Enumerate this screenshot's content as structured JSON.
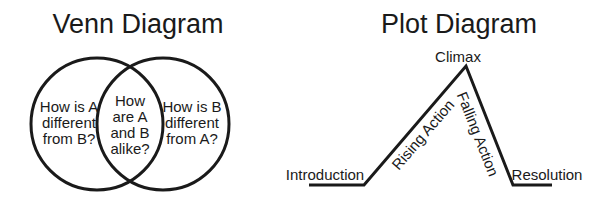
{
  "venn": {
    "title": "Venn Diagram",
    "left_region": [
      "How is A",
      "different",
      "from B?"
    ],
    "center_region": [
      "How",
      "are A",
      "and B",
      "alike?"
    ],
    "right_region": [
      "How is B",
      "different",
      "from A?"
    ]
  },
  "plot": {
    "title": "Plot Diagram",
    "stages": {
      "introduction": "Introduction",
      "rising_action": "Rising Action",
      "climax": "Climax",
      "falling_action": "Falling Action",
      "resolution": "Resolution"
    }
  },
  "colors": {
    "stroke": "#1a1a1a",
    "background": "#ffffff"
  }
}
